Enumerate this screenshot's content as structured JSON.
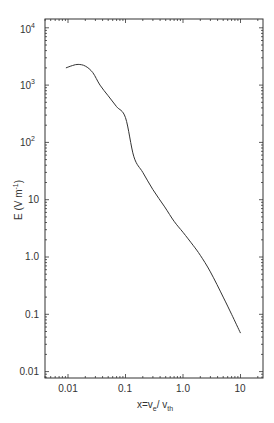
{
  "chart_data": {
    "type": "line",
    "title": "",
    "xlabel": "x=v_e / v_th",
    "ylabel": "E (V m^-1)",
    "xscale": "log",
    "yscale": "log",
    "xlim": [
      0.004,
      25
    ],
    "ylim": [
      0.008,
      15000
    ],
    "grid": false,
    "legend": null,
    "x_ticks": [
      "0.01",
      "0.1",
      "1.0",
      "10"
    ],
    "y_ticks": [
      "0.01",
      "0.1",
      "1.0",
      "10",
      "10^2",
      "10^3",
      "10^4"
    ],
    "series": [
      {
        "name": "E",
        "color": "#333333",
        "x": [
          0.0092,
          0.012,
          0.015,
          0.02,
          0.027,
          0.036,
          0.05,
          0.07,
          0.1,
          0.14,
          0.2,
          0.3,
          0.48,
          0.7,
          1.0,
          1.5,
          2.0,
          3.0,
          5.0,
          7.0,
          10.0
        ],
        "values": [
          2000,
          2200,
          2300,
          2150,
          1650,
          1000,
          650,
          420,
          270,
          56,
          30,
          15,
          7.5,
          4.2,
          2.7,
          1.6,
          1.07,
          0.55,
          0.2,
          0.1,
          0.047
        ]
      }
    ]
  },
  "axes": {
    "x_label_main": "x=v",
    "x_label_sub1": "e",
    "x_label_mid": "/ v",
    "x_label_sub2": "th",
    "y_label_main": "E (V m",
    "y_label_sup": "-1",
    "y_label_end": ")",
    "x_tick_labels": [
      "0.01",
      "0.1",
      "1.0",
      "10"
    ],
    "y_tick_labels": [
      {
        "base": "0.01",
        "exp": ""
      },
      {
        "base": "0.1",
        "exp": ""
      },
      {
        "base": "1.0",
        "exp": ""
      },
      {
        "base": "10",
        "exp": ""
      },
      {
        "base": "10",
        "exp": "2"
      },
      {
        "base": "10",
        "exp": "3"
      },
      {
        "base": "10",
        "exp": "4"
      }
    ]
  }
}
